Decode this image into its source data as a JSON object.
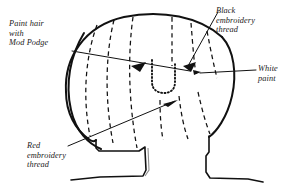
{
  "diagram": {
    "ink_color": "#111111",
    "background_color": "#ffffff",
    "width": 289,
    "height": 189,
    "labels": [
      {
        "id": "paint-hair",
        "lines": [
          "Paint hair",
          "with",
          "Mod Podge"
        ],
        "points_to": "hair-area-left"
      },
      {
        "id": "black-thread",
        "lines": [
          "Black",
          "embroidery",
          "thread"
        ],
        "points_to": "right-eye"
      },
      {
        "id": "white-paint",
        "lines": [
          "White",
          "paint"
        ],
        "points_to": "face-highlight"
      },
      {
        "id": "red-thread",
        "lines": [
          "Red",
          "embroidery",
          "thread"
        ],
        "points_to": "mouth"
      }
    ],
    "parts": {
      "head_outline": "head-outline",
      "hair_part_lines": "dashed-hair-lines",
      "nose": "stippled-nose",
      "left_eye": "left-eye-arrowhead",
      "right_eye": "right-eye-arrowhead",
      "body": "body-shoulders"
    }
  }
}
